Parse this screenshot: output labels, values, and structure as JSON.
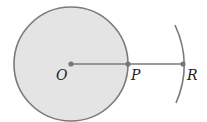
{
  "diagram": {
    "labels": {
      "center": "O",
      "point_on_circle": "P",
      "point_on_arc": "R"
    },
    "colors": {
      "circle_fill": "#e4e4e4",
      "stroke": "#7a7a7a",
      "point": "#777777",
      "text": "#222222"
    }
  }
}
